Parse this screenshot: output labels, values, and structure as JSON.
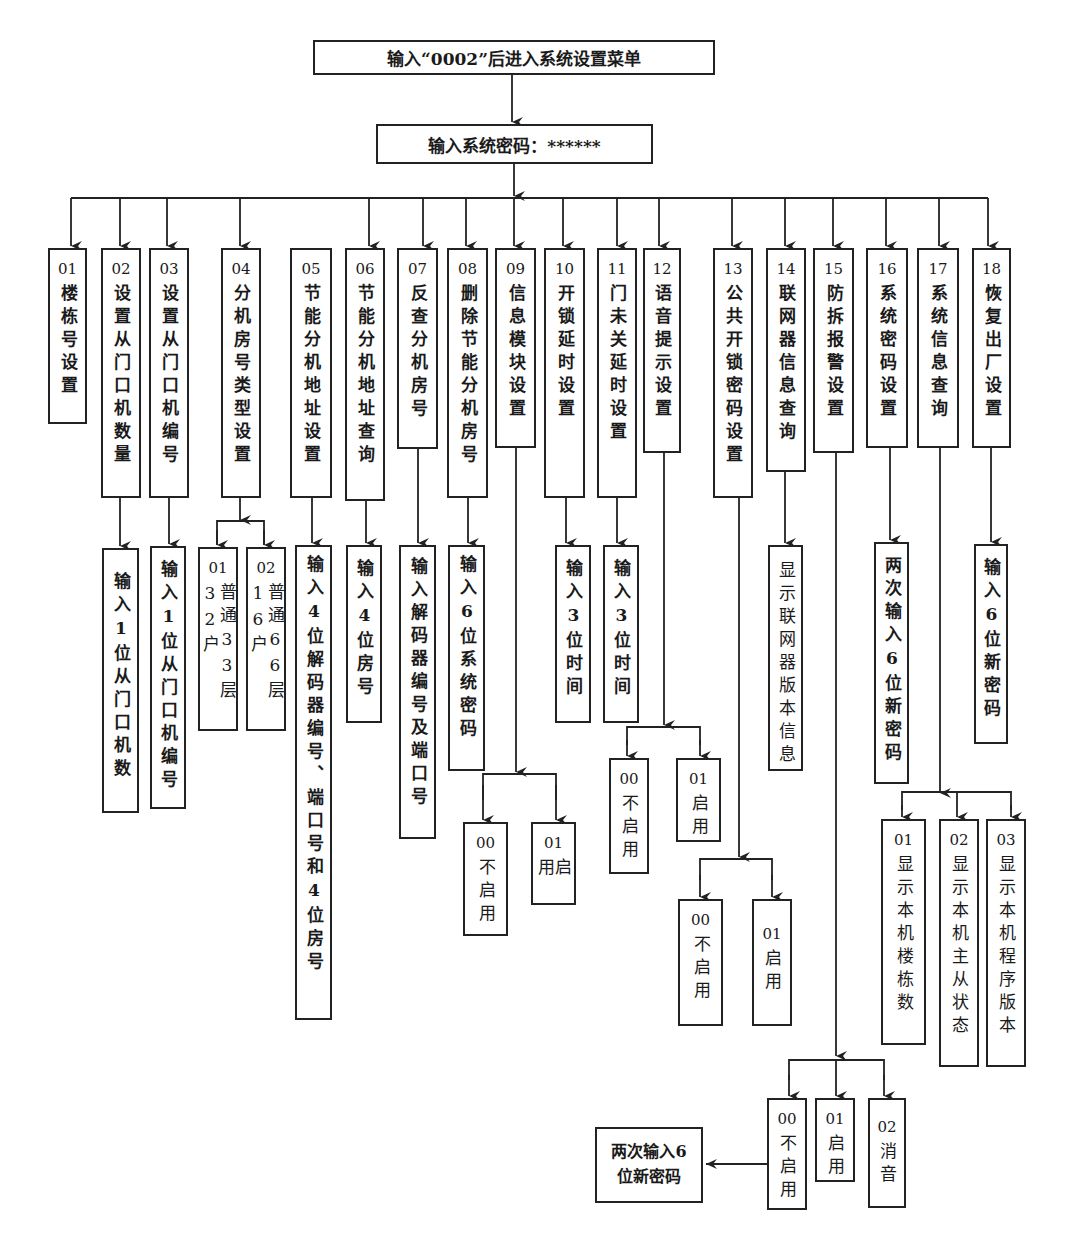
{
  "root": {
    "label": "输入“0002”后进入系统设置菜单"
  },
  "password": {
    "label": "输入系统密码：******"
  },
  "menu": [
    {
      "num": "01",
      "label": "楼栋号设置"
    },
    {
      "num": "02",
      "label": "设置从门口机数量",
      "child": "输入1位从门口机数"
    },
    {
      "num": "03",
      "label": "设置从门口机编号",
      "child": "输入1位从门口机编号"
    },
    {
      "num": "04",
      "label": "分机房号类型设置",
      "options": [
        {
          "num": "01",
          "label": "普通33层32户"
        },
        {
          "num": "02",
          "label": "普通66层16户"
        }
      ]
    },
    {
      "num": "05",
      "label": "节能分机地址设置",
      "child": "输入4位解码器编号、端口号和4位房号"
    },
    {
      "num": "06",
      "label": "节能分机地址查询",
      "child": "输入4位房号"
    },
    {
      "num": "07",
      "label": "反查分机房号",
      "child": "输入解码器编号及端口号"
    },
    {
      "num": "08",
      "label": "删除节能分机房号",
      "child": "输入6位系统密码"
    },
    {
      "num": "09",
      "label": "信息模块设置",
      "options": [
        {
          "num": "00",
          "label": "不启用"
        },
        {
          "num": "01",
          "label": "启用"
        }
      ]
    },
    {
      "num": "10",
      "label": "开锁延时设置",
      "child": "输入3位时间"
    },
    {
      "num": "11",
      "label": "门未关延时设置",
      "child": "输入3位时间"
    },
    {
      "num": "12",
      "label": "语音提示设置",
      "options": [
        {
          "num": "00",
          "label": "不启用"
        },
        {
          "num": "01",
          "label": "启用"
        }
      ]
    },
    {
      "num": "13",
      "label": "公共开锁密码设置",
      "options": [
        {
          "num": "00",
          "label": "不启用"
        },
        {
          "num": "01",
          "label": "启用"
        }
      ]
    },
    {
      "num": "14",
      "label": "联网器信息查询",
      "child": "显示联网器版本信息"
    },
    {
      "num": "15",
      "label": "防拆报警设置",
      "options": [
        {
          "num": "00",
          "label": "不启用"
        },
        {
          "num": "01",
          "label": "启用"
        },
        {
          "num": "02",
          "label": "消音"
        }
      ],
      "extra": "两次输入6位新密码"
    },
    {
      "num": "16",
      "label": "系统密码设置",
      "child": "两次输入6位新密码"
    },
    {
      "num": "17",
      "label": "系统信息查询",
      "options": [
        {
          "num": "01",
          "label": "显示本机楼栋数"
        },
        {
          "num": "02",
          "label": "显示本机主从状态"
        },
        {
          "num": "03",
          "label": "显示本机程序版本"
        }
      ]
    },
    {
      "num": "18",
      "label": "恢复出厂设置",
      "child": "输入6位新密码"
    }
  ],
  "extra_box": {
    "line1": "两次输入6",
    "line2": "位新密码"
  }
}
